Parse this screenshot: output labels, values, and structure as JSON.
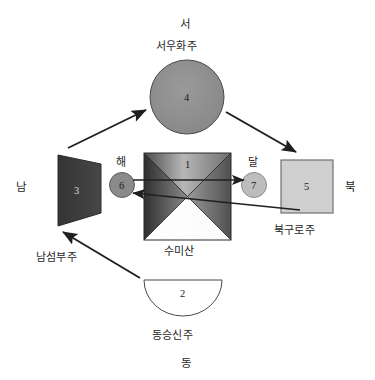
{
  "diagram": {
    "title_hidden": "",
    "directions": {
      "west": "서",
      "east": "동",
      "south": "남",
      "north": "북"
    },
    "celestial": {
      "sun_label": "해",
      "moon_label": "달"
    },
    "center": {
      "number": "1",
      "name": "수미산"
    },
    "continents": [
      {
        "number": "4",
        "name": "서우화주",
        "direction": "서",
        "shape": "circle",
        "fill": "#8f8f8f"
      },
      {
        "number": "3",
        "name": "남섬부주",
        "direction": "남",
        "shape": "trapezoid",
        "fill": "#3a3a3a"
      },
      {
        "number": "5",
        "name": "북구로주",
        "direction": "북",
        "shape": "square",
        "fill": "#cfcfcf"
      },
      {
        "number": "2",
        "name": "동승신주",
        "direction": "동",
        "shape": "semicircle",
        "fill": "#ffffff"
      }
    ],
    "bodies": [
      {
        "number": "6",
        "label": "해",
        "fill": "#8a8a8a"
      },
      {
        "number": "7",
        "label": "달",
        "fill": "#bdbdbd"
      }
    ],
    "colors": {
      "stroke": "#1f1f1f",
      "background": "#ffffff",
      "mountain_light": "#c9c9c9",
      "mountain_dark": "#3f3f3f",
      "text": "#262626"
    }
  }
}
